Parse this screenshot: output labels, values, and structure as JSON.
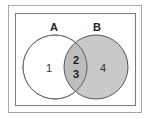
{
  "diagram": {
    "type": "venn",
    "sets": [
      {
        "label": "A",
        "fill": "#ffffff",
        "stroke": "#8a8a8a"
      },
      {
        "label": "B",
        "fill": "#c9c9c9",
        "stroke": "#555555"
      }
    ],
    "regions": {
      "a_only": "1",
      "intersection_top": "2",
      "intersection_bottom": "3",
      "b_only": "4"
    },
    "intersection_fill": "#bdbdbd"
  }
}
